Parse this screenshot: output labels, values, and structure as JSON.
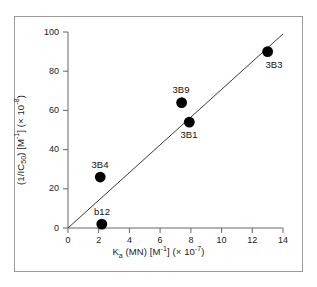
{
  "chart_data": {
    "type": "scatter",
    "title": "",
    "xlabel": "K_a (MN) [M^-1] (x 10^-7)",
    "ylabel": "(1/IC_50) [M^-1] (x 10^-8)",
    "xlim": [
      0,
      14
    ],
    "ylim": [
      0,
      100
    ],
    "xticks": [
      0,
      2,
      4,
      6,
      8,
      10,
      12,
      14
    ],
    "yticks": [
      0,
      20,
      40,
      60,
      80,
      100
    ],
    "grid": false,
    "legend": "none",
    "points": [
      {
        "label": "b12",
        "x": 2.2,
        "y": 2,
        "label_position": "above"
      },
      {
        "label": "3B4",
        "x": 2.1,
        "y": 26,
        "label_position": "above"
      },
      {
        "label": "3B9",
        "x": 7.4,
        "y": 64,
        "label_position": "above"
      },
      {
        "label": "3B1",
        "x": 7.9,
        "y": 54,
        "label_position": "below"
      },
      {
        "label": "3B3",
        "x": 13.0,
        "y": 90,
        "label_position": "below-right"
      }
    ],
    "fit_line": {
      "type": "linear",
      "through_origin": true,
      "x_start": 0,
      "y_start": 0,
      "x_end": 14.0,
      "y_end": 99.0
    },
    "marker_color": "#000000",
    "line_color": "#3a3a3a",
    "axis_color": "#666666",
    "frame_color": "#9b9b9b",
    "background_color": "#ffffff"
  },
  "axes": {
    "x_title_parts": {
      "symbol": "K",
      "symbol_sub": "a",
      "mid": " (MN) [M",
      "mid_sup": "-1",
      "tail": "] (× 10",
      "tail_sup": "-7",
      "end": ")"
    },
    "y_title_parts": {
      "head": "(1/IC",
      "head_sub": "50",
      "mid": ") [M",
      "mid_sup": "-1",
      "tail": "] (× 10",
      "tail_sup": "-8",
      "end": ")"
    },
    "x_tick_labels": [
      "0",
      "2",
      "4",
      "6",
      "8",
      "10",
      "12",
      "14"
    ],
    "y_tick_labels": [
      "0",
      "20",
      "40",
      "60",
      "80",
      "100"
    ]
  }
}
